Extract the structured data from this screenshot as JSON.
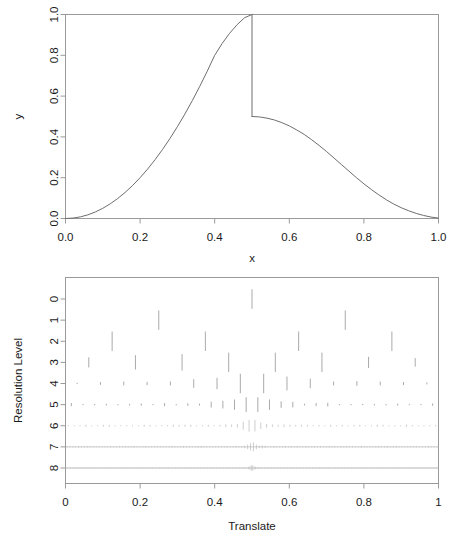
{
  "figure": {
    "background": "#ffffff",
    "line_color": "#6e6e6e",
    "axis_color": "#9a9a9a",
    "text_color": "#1a1a1a"
  },
  "chart_data": [
    {
      "type": "line",
      "panel": "top",
      "title": "",
      "xlabel": "x",
      "ylabel": "y",
      "xlim": [
        0.0,
        1.0
      ],
      "ylim": [
        0.0,
        1.0
      ],
      "grid": false,
      "legend": "none",
      "xticks": [
        0.0,
        0.2,
        0.4,
        0.6,
        0.8,
        1.0
      ],
      "xticklabels": [
        "0.0",
        "0.2",
        "0.4",
        "0.6",
        "0.8",
        "1.0"
      ],
      "yticks": [
        0.0,
        0.2,
        0.4,
        0.6,
        0.8,
        1.0
      ],
      "yticklabels": [
        "0.0",
        "0.2",
        "0.4",
        "0.6",
        "0.8",
        "1.0"
      ],
      "description": "Smooth rising curve from (0,0) to a peak of 1.0 at x=0.5, a vertical jump discontinuity down to 0.5, then a smooth decay back to 0 at x=1.0",
      "series": [
        {
          "name": "signal",
          "x": [
            0.0,
            0.02,
            0.04,
            0.06,
            0.08,
            0.1,
            0.12,
            0.14,
            0.16,
            0.18,
            0.2,
            0.22,
            0.24,
            0.26,
            0.28,
            0.3,
            0.32,
            0.34,
            0.36,
            0.38,
            0.4,
            0.42,
            0.44,
            0.46,
            0.48,
            0.5
          ],
          "y": [
            0.0,
            0.002,
            0.008,
            0.018,
            0.032,
            0.05,
            0.072,
            0.098,
            0.128,
            0.162,
            0.2,
            0.242,
            0.288,
            0.338,
            0.392,
            0.45,
            0.512,
            0.578,
            0.648,
            0.722,
            0.8,
            0.858,
            0.908,
            0.95,
            0.984,
            1.0
          ]
        },
        {
          "name": "signal-after-jump",
          "x": [
            0.5,
            0.52,
            0.54,
            0.56,
            0.58,
            0.6,
            0.62,
            0.64,
            0.66,
            0.68,
            0.7,
            0.72,
            0.74,
            0.76,
            0.78,
            0.8,
            0.82,
            0.84,
            0.86,
            0.88,
            0.9,
            0.92,
            0.94,
            0.96,
            0.98,
            1.0
          ],
          "y": [
            0.5,
            0.498,
            0.492,
            0.483,
            0.47,
            0.454,
            0.434,
            0.412,
            0.386,
            0.358,
            0.328,
            0.296,
            0.264,
            0.232,
            0.2,
            0.17,
            0.142,
            0.116,
            0.092,
            0.071,
            0.053,
            0.038,
            0.025,
            0.015,
            0.007,
            0.002
          ]
        }
      ],
      "jump": {
        "x": 0.5,
        "from": 1.0,
        "to": 0.5
      }
    },
    {
      "type": "scatter",
      "panel": "bottom",
      "title": "",
      "xlabel": "Translate",
      "ylabel": "Resolution Level",
      "xlim": [
        0.0,
        1.0
      ],
      "grid": false,
      "legend": "none",
      "xticks": [
        0.0,
        0.2,
        0.4,
        0.6,
        0.8,
        1.0
      ],
      "xticklabels": [
        "0",
        "0.2",
        "0.4",
        "0.6",
        "0.8",
        "1"
      ],
      "yticks": [
        0,
        1,
        2,
        3,
        4,
        5,
        6,
        7,
        8
      ],
      "yticklabels": [
        "0",
        "1",
        "2",
        "3",
        "4",
        "5",
        "6",
        "7",
        "8"
      ],
      "description": "Wavelet coefficient stick plot by resolution level; level 0 has 1 coefficient, level k has 2^k coefficients drawn as vertical sticks centred on the level baseline",
      "levels": [
        {
          "level": 0,
          "n": 1,
          "max_abs": 1.0
        },
        {
          "level": 1,
          "n": 2,
          "max_abs": 0.42
        },
        {
          "level": 2,
          "n": 4,
          "max_abs": 0.3
        },
        {
          "level": 3,
          "n": 8,
          "max_abs": 0.22
        },
        {
          "level": 4,
          "n": 16,
          "max_abs": 0.16
        },
        {
          "level": 5,
          "n": 32,
          "max_abs": 0.12
        },
        {
          "level": 6,
          "n": 64,
          "max_abs": 0.09
        },
        {
          "level": 7,
          "n": 128,
          "max_abs": 0.06
        },
        {
          "level": 8,
          "n": 256,
          "max_abs": 0.04
        }
      ]
    }
  ]
}
